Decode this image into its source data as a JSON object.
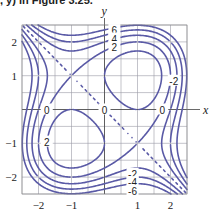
{
  "caption": ", y) in Figure 3.25.",
  "chart_data": {
    "type": "contour",
    "function": "x^3 - 3x + y^3 - 3y",
    "title": "",
    "xlabel": "x",
    "ylabel": "y",
    "xlim": [
      -2.5,
      2.5
    ],
    "ylim": [
      -2.5,
      2.5
    ],
    "grid": true,
    "grid_step": 0.5,
    "x_ticks": [
      -2,
      -1,
      1,
      2
    ],
    "y_ticks": [
      -2,
      -1,
      1,
      2
    ],
    "levels": [
      -6,
      -4,
      -2,
      0,
      2,
      4,
      6
    ],
    "contour_labels": [
      {
        "text": "6",
        "x": 0.3,
        "y": 2.35
      },
      {
        "text": "4",
        "x": 0.3,
        "y": 2.1
      },
      {
        "text": "2",
        "x": 0.3,
        "y": 1.85
      },
      {
        "text": "-2",
        "x": 2.1,
        "y": 0.85
      },
      {
        "text": "0",
        "x": -1.75,
        "y": 0.0
      },
      {
        "text": "0",
        "x": 0.0,
        "y": 0.0
      },
      {
        "text": "0",
        "x": 1.75,
        "y": 0.0
      },
      {
        "text": "2",
        "x": -1.75,
        "y": -0.95
      },
      {
        "text": "-2",
        "x": 0.85,
        "y": -1.9
      },
      {
        "text": "-4",
        "x": 0.85,
        "y": -2.15
      },
      {
        "text": "-6",
        "x": 0.85,
        "y": -2.4
      }
    ],
    "line_color": "#5a5aa6",
    "grid_color": "#9a9aa6"
  }
}
